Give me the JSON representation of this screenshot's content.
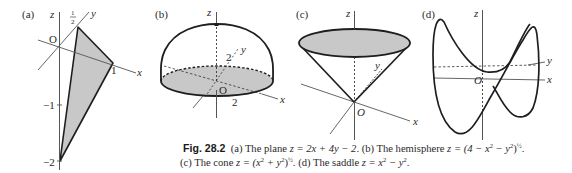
{
  "figure": {
    "number": "Fig. 28.2",
    "panels": [
      {
        "id": "a",
        "label": "(a)",
        "description": "The plane",
        "equation": "z = 2x + 4y − 2",
        "axis_labels": {
          "x": "x",
          "y": "y",
          "z": "z",
          "origin": "O"
        },
        "tick_labels": {
          "y_half": "1/2",
          "x_one": "1",
          "z_minus1": "−1",
          "z_minus2": "−2"
        }
      },
      {
        "id": "b",
        "label": "(b)",
        "description": "The hemisphere",
        "equation": "z = (4 − x² − y²)^½",
        "axis_labels": {
          "x": "x",
          "y": "y",
          "z": "z",
          "origin": "O"
        },
        "tick_labels": {
          "y_two": "2",
          "x_two": "2"
        }
      },
      {
        "id": "c",
        "label": "(c)",
        "description": "The cone",
        "equation": "z = (x² + y²)^½",
        "axis_labels": {
          "x": "x",
          "y": "y",
          "z": "z",
          "origin": "O"
        }
      },
      {
        "id": "d",
        "label": "(d)",
        "description": "The saddle",
        "equation": "z = x² − y²",
        "axis_labels": {
          "x": "x",
          "y": "y",
          "z": "z",
          "origin": "O"
        }
      }
    ],
    "caption": {
      "a_prefix": "(a) The plane ",
      "a_eq": "z = 2x + 4y − 2",
      "b_prefix": ". (b) The hemisphere ",
      "b_eq_open": "z = (4 − x",
      "b_eq_mid": " − y",
      "b_eq_close": ")",
      "c_prefix": "(c) The cone ",
      "c_eq_open": "z = (x",
      "c_eq_mid": " + y",
      "c_eq_close": ")",
      "d_prefix": ". (d) The saddle ",
      "d_eq_open": "z = x",
      "d_eq_mid": " − y",
      "sq": "2",
      "half": "½",
      "dot": "."
    }
  },
  "colors": {
    "shade": "#c8c8c8",
    "line": "#1e1e1e",
    "axis": "#555555"
  }
}
